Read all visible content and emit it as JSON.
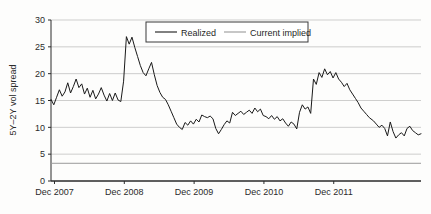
{
  "chart_data": {
    "type": "line",
    "title": "",
    "xlabel": "",
    "ylabel": "5Y–2Y vol spread",
    "ylim": [
      0,
      30
    ],
    "yticks": [
      0,
      5,
      10,
      15,
      20,
      25,
      30
    ],
    "ytick_labels": [
      "0",
      "5",
      "10",
      "15",
      "20",
      "25",
      "30"
    ],
    "xtick_labels": [
      "Dec 2007",
      "Dec 2008",
      "Dec 2009",
      "Dec 2010",
      "Dec 2011"
    ],
    "xlim": [
      0,
      4.62
    ],
    "grid": true,
    "legend_position": "top-center",
    "series": [
      {
        "name": "Realized",
        "color": "#1a1a1a",
        "style": "solid",
        "x": [
          0.0,
          0.04,
          0.08,
          0.12,
          0.16,
          0.2,
          0.24,
          0.28,
          0.32,
          0.36,
          0.4,
          0.44,
          0.48,
          0.52,
          0.56,
          0.6,
          0.64,
          0.68,
          0.72,
          0.76,
          0.8,
          0.84,
          0.88,
          0.92,
          0.96,
          1.0,
          1.04,
          1.08,
          1.12,
          1.16,
          1.2,
          1.24,
          1.28,
          1.32,
          1.36,
          1.4,
          1.44,
          1.48,
          1.52,
          1.56,
          1.6,
          1.64,
          1.68,
          1.72,
          1.76,
          1.8,
          1.84,
          1.88,
          1.92,
          1.96,
          2.0,
          2.04,
          2.08,
          2.12,
          2.16,
          2.2,
          2.24,
          2.28,
          2.32,
          2.36,
          2.4,
          2.44,
          2.48,
          2.52,
          2.56,
          2.6,
          2.64,
          2.68,
          2.72,
          2.76,
          2.8,
          2.84,
          2.88,
          2.92,
          2.96,
          3.0,
          3.04,
          3.08,
          3.12,
          3.16,
          3.2,
          3.24,
          3.28,
          3.32,
          3.36,
          3.4,
          3.44,
          3.48,
          3.52,
          3.56,
          3.6,
          3.64,
          3.68,
          3.72,
          3.76,
          3.8,
          3.84,
          3.88,
          3.92,
          3.96,
          4.0,
          4.04,
          4.08,
          4.12,
          4.16,
          4.2,
          4.24,
          4.28,
          4.32,
          4.36,
          4.4,
          4.44,
          4.48,
          4.52,
          4.56,
          4.62
        ],
        "y": [
          15.2,
          14.2,
          15.6,
          17.0,
          15.8,
          16.6,
          18.3,
          16.4,
          17.6,
          19.0,
          17.4,
          18.1,
          16.2,
          17.3,
          15.6,
          16.9,
          15.3,
          16.2,
          17.4,
          16.0,
          14.9,
          16.3,
          15.0,
          16.4,
          15.1,
          14.8,
          18.6,
          26.9,
          25.5,
          26.8,
          24.9,
          23.2,
          21.5,
          20.2,
          19.6,
          20.9,
          22.1,
          19.8,
          17.8,
          16.5,
          15.6,
          15.2,
          14.2,
          13.0,
          11.8,
          10.6,
          10.0,
          9.6,
          10.9,
          10.4,
          11.2,
          10.6,
          11.5,
          11.0,
          12.3,
          12.0,
          11.8,
          12.1,
          11.6,
          9.8,
          8.8,
          9.6,
          10.5,
          11.2,
          10.8,
          12.8,
          12.2,
          12.6,
          13.0,
          12.4,
          12.8,
          13.2,
          12.6,
          13.6,
          12.9,
          13.4,
          12.2,
          12.0,
          11.6,
          12.2,
          11.5,
          12.0,
          11.2,
          11.6,
          10.8,
          10.2,
          11.0,
          10.6,
          9.7,
          12.8,
          14.2,
          13.4,
          13.8,
          12.6,
          19.0,
          18.0,
          20.2,
          19.3,
          20.9,
          19.8,
          20.4,
          19.2,
          20.2,
          19.0,
          18.4,
          17.6,
          18.2,
          17.0,
          16.2,
          15.4,
          14.6,
          13.6,
          13.0,
          12.4,
          11.8,
          11.2
        ]
      },
      {
        "name": "Current implied",
        "color": "#8a8a8a",
        "style": "solid",
        "constant_value": 3.3
      }
    ],
    "realized_tail": {
      "x": [
        4.62,
        4.66,
        4.7,
        4.74,
        4.78,
        4.82,
        4.86,
        4.9,
        4.94,
        4.98,
        5.02,
        5.06,
        5.1,
        5.14,
        5.18,
        5.22,
        5.26,
        5.3
      ],
      "y": [
        11.2,
        10.6,
        10.0,
        10.4,
        9.8,
        8.4,
        11.0,
        9.2,
        8.0,
        8.6,
        9.0,
        8.4,
        9.8,
        10.2,
        9.4,
        9.0,
        8.6,
        8.8
      ]
    }
  },
  "legend": {
    "items": [
      {
        "label": "Realized",
        "color": "#1a1a1a"
      },
      {
        "label": "Current implied",
        "color": "#9a9a9a"
      }
    ]
  }
}
